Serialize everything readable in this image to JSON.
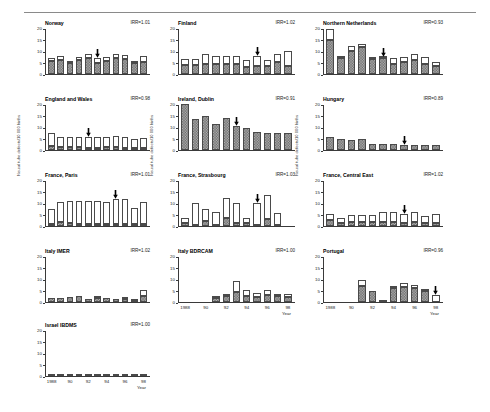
{
  "figure": {
    "y_axis_label": "Neural tube defects/10 000 births",
    "x_axis_label": "Year",
    "x_tick_labels": [
      "1988",
      "90",
      "92",
      "94",
      "96",
      "98"
    ],
    "y_tick_labels": [
      "0",
      "5",
      "10",
      "15",
      "20"
    ],
    "ylim": [
      0,
      20
    ],
    "xlim": [
      1988,
      1998
    ],
    "legend": {
      "dark_series": "Livebirths and stillbirths",
      "light_series": "Terminations of pregnancy"
    },
    "annotation_marker": "arrow-down",
    "annotation_meaning": "Date of folic acid recommendation",
    "colors": {
      "dark_fill": "#9a9a9a",
      "light_fill": "#ffffff",
      "outline": "#4a4a4a",
      "axis": "#3a3a3a",
      "rule": "#8a8a8a"
    }
  },
  "chart_data": {
    "type": "bar",
    "title": "",
    "xlabel": "Year",
    "ylabel": "Neural tube defects/10 000 births",
    "ylim": [
      0,
      20
    ],
    "grid": false,
    "legend_position": "none",
    "stacked": true,
    "panels": [
      {
        "name": "Norway",
        "irr_label": "IRR=1.01",
        "irr_value": 1.01,
        "arrow_year": 1993,
        "years": [
          1988,
          1989,
          1990,
          1991,
          1992,
          1993,
          1994,
          1995,
          1996,
          1997,
          1998
        ],
        "series": [
          {
            "name": "Livebirths and stillbirths",
            "values": [
              5.8,
              6.2,
              5.0,
              6.0,
              6.8,
              4.7,
              5.7,
              7.0,
              6.5,
              4.6,
              5.4
            ]
          },
          {
            "name": "Terminations of pregnancy",
            "values": [
              1.0,
              1.7,
              0.6,
              1.5,
              1.8,
              2.2,
              1.8,
              1.9,
              1.9,
              1.0,
              2.3
            ]
          }
        ],
        "totals": [
          6.8,
          7.9,
          5.6,
          7.5,
          8.6,
          6.9,
          7.5,
          8.9,
          8.4,
          5.6,
          7.7
        ]
      },
      {
        "name": "England and Wales",
        "irr_label": "IRR=0.98",
        "irr_value": 0.98,
        "arrow_year": 1992,
        "years": [
          1988,
          1989,
          1990,
          1991,
          1992,
          1993,
          1994,
          1995,
          1996,
          1997,
          1998
        ],
        "years_shown": [
          1988,
          1989,
          1990,
          1991,
          1992,
          1993,
          1994,
          1995,
          1996,
          1997,
          1998
        ],
        "series": [
          {
            "name": "Livebirths and stillbirths",
            "values": [
              1.9,
              1.3,
              1.1,
              1.1,
              1.0,
              1.0,
              1.1,
              1.1,
              1.0,
              0.9,
              0.9
            ]
          },
          {
            "name": "Terminations of pregnancy",
            "values": [
              5.5,
              4.4,
              4.6,
              4.6,
              4.6,
              4.7,
              4.7,
              4.8,
              4.8,
              4.0,
              4.4
            ]
          }
        ],
        "totals": [
          7.4,
          5.7,
          5.7,
          5.7,
          5.6,
          5.7,
          5.8,
          5.9,
          5.8,
          4.9,
          5.3
        ]
      },
      {
        "name": "France, Paris",
        "irr_label": "IRR=1.01",
        "irr_value": 1.01,
        "arrow_year": 1995,
        "years": [
          1988,
          1989,
          1990,
          1991,
          1992,
          1993,
          1994,
          1995,
          1996,
          1997,
          1998
        ],
        "series": [
          {
            "name": "Livebirths and stillbirths",
            "values": [
              0.9,
              1.6,
              1.2,
              0.9,
              0.9,
              0.9,
              0.9,
              0.9,
              0.9,
              0.8,
              0.9
            ]
          },
          {
            "name": "Terminations of pregnancy",
            "values": [
              6.6,
              9.0,
              9.6,
              9.8,
              10.0,
              10.0,
              9.7,
              11.0,
              10.7,
              7.2,
              9.6
            ]
          }
        ],
        "totals": [
          7.5,
          10.6,
          10.8,
          10.7,
          10.9,
          10.9,
          10.6,
          11.9,
          11.6,
          8.0,
          10.5
        ]
      },
      {
        "name": "Italy IMER",
        "irr_label": "IRR=1.02",
        "irr_value": 1.02,
        "arrow_year": null,
        "years": [
          1988,
          1989,
          1990,
          1991,
          1992,
          1993,
          1994,
          1995,
          1996,
          1997,
          1998
        ],
        "series": [
          {
            "name": "Livebirths and stillbirths",
            "values": [
              1.6,
              1.7,
              2.1,
              2.8,
              1.4,
              1.6,
              1.7,
              1.2,
              1.3,
              0.3,
              2.5
            ]
          },
          {
            "name": "Terminations of pregnancy",
            "values": [
              0.0,
              0.0,
              0.0,
              0.0,
              0.0,
              0.6,
              0.0,
              0.0,
              0.7,
              0.7,
              2.6
            ]
          }
        ],
        "totals": [
          1.6,
          1.7,
          2.1,
          2.8,
          1.4,
          2.2,
          1.7,
          1.2,
          2.0,
          1.0,
          5.1
        ]
      },
      {
        "name": "Israel IBDMS",
        "irr_label": "IRR=1.00",
        "irr_value": 1.0,
        "arrow_year": null,
        "years": [
          1988,
          1989,
          1990,
          1991,
          1992,
          1993,
          1994,
          1995,
          1996,
          1997,
          1998
        ],
        "series": [
          {
            "name": "Livebirths and stillbirths",
            "values": [
              0.5,
              0.2,
              0.5,
              0.2,
              0.2,
              0.2,
              0.2,
              0.0,
              0.5,
              0.2,
              0.5
            ]
          },
          {
            "name": "Terminations of pregnancy",
            "values": [
              0.0,
              0.0,
              0.0,
              0.0,
              0.0,
              0.0,
              0.0,
              0.6,
              0.0,
              0.0,
              0.0
            ]
          }
        ],
        "totals": [
          0.5,
          0.2,
          0.5,
          0.2,
          0.2,
          0.2,
          0.2,
          0.6,
          0.5,
          0.2,
          0.5
        ]
      },
      {
        "name": "Finland",
        "irr_label": "IRR=1.02",
        "irr_value": 1.02,
        "arrow_year": 1995,
        "years": [
          1988,
          1989,
          1990,
          1991,
          1992,
          1993,
          1994,
          1995,
          1996,
          1997,
          1998
        ],
        "series": [
          {
            "name": "Livebirths and stillbirths",
            "values": [
              3.9,
              4.1,
              4.4,
              4.2,
              4.3,
              4.5,
              3.0,
              3.7,
              3.6,
              5.2,
              3.4
            ]
          },
          {
            "name": "Terminations of pregnancy",
            "values": [
              2.6,
              2.5,
              4.1,
              3.7,
              3.6,
              3.5,
              3.1,
              4.2,
              2.6,
              3.5,
              6.5
            ]
          }
        ],
        "totals": [
          6.5,
          6.6,
          8.5,
          7.9,
          7.9,
          8.0,
          6.1,
          7.9,
          6.2,
          8.7,
          9.9
        ]
      },
      {
        "name": "Ireland, Dublin",
        "irr_label": "IRR=0.91",
        "irr_value": 0.91,
        "arrow_year": 1993,
        "years": [
          1988,
          1989,
          1990,
          1991,
          1992,
          1993,
          1994,
          1995,
          1996,
          1997,
          1998
        ],
        "series": [
          {
            "name": "Livebirths and stillbirths",
            "values": [
              20.0,
              13.3,
              14.9,
              11.1,
              14.0,
              10.6,
              9.4,
              7.8,
              7.5,
              7.4,
              7.4
            ]
          },
          {
            "name": "Terminations of pregnancy",
            "values": [
              0.0,
              0.0,
              0.0,
              0.0,
              0.0,
              0.0,
              0.0,
              0.0,
              0.0,
              0.0,
              0.0
            ]
          }
        ],
        "totals": [
          20.0,
          13.3,
          14.9,
          11.1,
          14.0,
          10.6,
          9.4,
          7.8,
          7.5,
          7.4,
          7.4
        ]
      },
      {
        "name": "France, Strasbourg",
        "irr_label": "IRR=1.03",
        "irr_value": 1.03,
        "arrow_year": 1995,
        "years": [
          1988,
          1989,
          1990,
          1991,
          1992,
          1993,
          1994,
          1995,
          1996,
          1997,
          1998
        ],
        "series": [
          {
            "name": "Livebirths and stillbirths",
            "values": [
              1.1,
              0.6,
              2.3,
              0.6,
              3.6,
              1.3,
              1.1,
              0.6,
              2.9,
              0.6,
              0.0
            ]
          },
          {
            "name": "Terminations of pregnancy",
            "values": [
              2.4,
              9.6,
              5.2,
              5.6,
              8.6,
              8.7,
              2.4,
              9.4,
              10.7,
              4.9,
              0.0
            ]
          }
        ],
        "totals": [
          3.5,
          10.2,
          7.5,
          6.2,
          12.2,
          10.0,
          3.5,
          10.0,
          13.6,
          5.5,
          0.0
        ]
      },
      {
        "name": "Italy BDRCAM",
        "irr_label": "IRR=1.00",
        "irr_value": 1.0,
        "arrow_year": null,
        "years": [
          1988,
          1989,
          1990,
          1991,
          1992,
          1993,
          1994,
          1995,
          1996,
          1997,
          1998
        ],
        "series": [
          {
            "name": "Livebirths and stillbirths",
            "values": [
              0.0,
              0.0,
              0.0,
              1.7,
              2.5,
              4.4,
              2.5,
              2.2,
              3.0,
              2.5,
              2.0
            ]
          },
          {
            "name": "Terminations of pregnancy",
            "values": [
              0.0,
              0.0,
              0.0,
              0.9,
              0.8,
              4.8,
              2.9,
              1.6,
              2.4,
              0.6,
              1.6
            ]
          }
        ],
        "totals": [
          0.0,
          0.0,
          0.0,
          2.6,
          3.3,
          9.2,
          5.4,
          3.8,
          5.4,
          3.1,
          3.6
        ]
      },
      {
        "name": "Northern Netherlands",
        "irr_label": "IRR=0.93",
        "irr_value": 0.93,
        "arrow_year": 1993,
        "years": [
          1988,
          1989,
          1990,
          1991,
          1992,
          1993,
          1994,
          1995,
          1996,
          1997,
          1998
        ],
        "series": [
          {
            "name": "Livebirths and stillbirths",
            "values": [
              14.9,
              6.8,
              9.8,
              11.9,
              6.7,
              6.8,
              4.2,
              5.3,
              6.3,
              4.3,
              3.4
            ]
          },
          {
            "name": "Terminations of pregnancy",
            "values": [
              4.7,
              0.7,
              2.3,
              1.3,
              0.8,
              0.7,
              2.6,
              2.0,
              2.6,
              3.3,
              1.7
            ]
          }
        ],
        "totals": [
          19.6,
          7.5,
          12.1,
          13.2,
          7.5,
          7.5,
          6.8,
          7.3,
          8.9,
          7.6,
          5.1
        ]
      },
      {
        "name": "Hungary",
        "irr_label": "IRR=0.89",
        "irr_value": 0.89,
        "arrow_year": 1995,
        "years": [
          1988,
          1989,
          1990,
          1991,
          1992,
          1993,
          1994,
          1995,
          1996,
          1997,
          1998
        ],
        "series": [
          {
            "name": "Livebirths and stillbirths",
            "values": [
              5.5,
              5.0,
              4.5,
              5.0,
              2.6,
              2.6,
              2.7,
              2.1,
              2.1,
              2.2,
              2.3
            ]
          },
          {
            "name": "Terminations of pregnancy",
            "values": [
              0.0,
              0.0,
              0.0,
              0.0,
              0.0,
              0.0,
              0.0,
              0.0,
              0.0,
              0.0,
              0.0
            ]
          }
        ],
        "totals": [
          5.5,
          5.0,
          4.5,
          5.0,
          2.6,
          2.6,
          2.7,
          2.1,
          2.1,
          2.2,
          2.3
        ]
      },
      {
        "name": "France, Central East",
        "irr_label": "IRR=1.02",
        "irr_value": 1.02,
        "arrow_year": 1995,
        "years": [
          1988,
          1989,
          1990,
          1991,
          1992,
          1993,
          1994,
          1995,
          1996,
          1997,
          1998
        ],
        "series": [
          {
            "name": "Livebirths and stillbirths",
            "values": [
              2.8,
              1.5,
              1.6,
              1.8,
              1.8,
              1.8,
              1.8,
              1.5,
              1.8,
              1.1,
              1.2
            ]
          },
          {
            "name": "Terminations of pregnancy",
            "values": [
              2.5,
              2.2,
              3.0,
              3.0,
              2.8,
              4.4,
              4.3,
              3.8,
              4.2,
              3.1,
              4.1
            ]
          }
        ],
        "totals": [
          5.3,
          3.7,
          4.6,
          4.8,
          4.6,
          6.2,
          6.1,
          5.3,
          6.0,
          4.2,
          5.3
        ]
      },
      {
        "name": "Portugal",
        "irr_label": "IRR=0.96",
        "irr_value": 0.96,
        "arrow_year": 1998,
        "years": [
          1988,
          1989,
          1990,
          1991,
          1992,
          1993,
          1994,
          1995,
          1996,
          1997,
          1998
        ],
        "series": [
          {
            "name": "Livebirths and stillbirths",
            "values": [
              0.0,
              0.0,
              0.0,
              7.1,
              4.9,
              0.5,
              5.9,
              6.4,
              5.9,
              4.6,
              0.0
            ]
          },
          {
            "name": "Terminations of pregnancy",
            "values": [
              0.0,
              0.0,
              0.0,
              2.3,
              0.0,
              0.0,
              0.9,
              1.9,
              1.5,
              0.6,
              3.0
            ]
          }
        ],
        "totals": [
          0.0,
          0.0,
          0.0,
          9.4,
          4.9,
          0.5,
          6.8,
          8.3,
          7.4,
          5.2,
          3.0
        ]
      }
    ]
  }
}
